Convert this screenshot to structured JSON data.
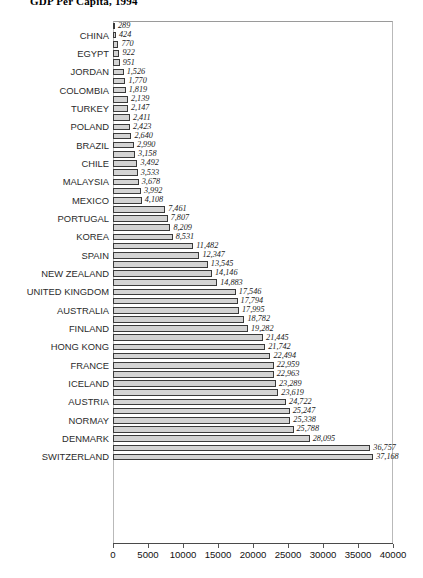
{
  "chart_data": {
    "type": "bar",
    "orientation": "horizontal",
    "title": "GDP Per Capita, 1994",
    "xlabel": "",
    "ylabel": "",
    "xlim": [
      0,
      40000
    ],
    "xticks": [
      0,
      5000,
      10000,
      15000,
      20000,
      25000,
      30000,
      35000,
      40000
    ],
    "xtick_labels": [
      "0",
      "5000",
      "10000",
      "15000",
      "20000",
      "25000",
      "30000",
      "35000",
      "40000"
    ],
    "grid": false,
    "legend": "none",
    "bar_color": "#d3d3d3",
    "bar_edge_color": "#3a3a3a",
    "note": "Country names are shown on every other bar; value labels are shown on all bars.",
    "categories": [
      "",
      "CHINA",
      "",
      "EGYPT",
      "",
      "JORDAN",
      "",
      "COLOMBIA",
      "",
      "TURKEY",
      "",
      "POLAND",
      "",
      "BRAZIL",
      "",
      "CHILE",
      "",
      "MALAYSIA",
      "",
      "MEXICO",
      "",
      "PORTUGAL",
      "",
      "KOREA",
      "",
      "SPAIN",
      "",
      "NEW ZEALAND",
      "",
      "UNITED KINGDOM",
      "",
      "AUSTRALIA",
      "",
      "FINLAND",
      "",
      "HONG KONG",
      "",
      "FRANCE",
      "",
      "ICELAND",
      "",
      "AUSTRIA",
      "",
      "NORMAY",
      "",
      "DENMARK",
      "",
      "SWITZERLAND"
    ],
    "values": [
      289,
      424,
      770,
      922,
      951,
      1526,
      1770,
      1819,
      2139,
      2147,
      2411,
      2423,
      2640,
      2990,
      3158,
      3492,
      3533,
      3678,
      3992,
      4108,
      7461,
      7807,
      8209,
      8531,
      11482,
      12347,
      13545,
      14146,
      14883,
      17546,
      17794,
      17995,
      18782,
      19282,
      21445,
      21742,
      22494,
      22959,
      22963,
      23289,
      23619,
      24722,
      25247,
      25338,
      25788,
      28095,
      36757,
      37168
    ],
    "value_labels": [
      "289",
      "424",
      "770",
      "922",
      "951",
      "1,526",
      "1,770",
      "1,819",
      "2,139",
      "2,147",
      "2,411",
      "2,423",
      "2,640",
      "2,990",
      "3,158",
      "3,492",
      "3,533",
      "3,678",
      "3,992",
      "4,108",
      "7,461",
      "7,807",
      "8,209",
      "8,531",
      "11,482",
      "12,347",
      "13,545",
      "14,146",
      "14,883",
      "17,546",
      "17,794",
      "17,995",
      "18,782",
      "19,282",
      "21,445",
      "21,742",
      "22,494",
      "22,959",
      "22,963",
      "23,289",
      "23,619",
      "24,722",
      "25,247",
      "25,338",
      "25,788",
      "28,095",
      "36,757",
      "37,168"
    ]
  }
}
